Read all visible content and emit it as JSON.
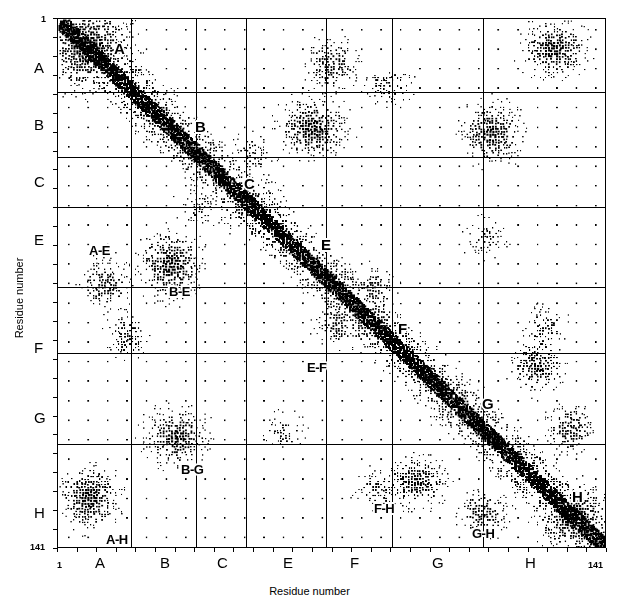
{
  "figure": {
    "type": "contact-map",
    "x_axis": {
      "title": "Residue number",
      "start_label": "1",
      "end_label": "141",
      "ticks": [
        {
          "label": "A",
          "pos_px": 100
        },
        {
          "label": "B",
          "pos_px": 165
        },
        {
          "label": "C",
          "pos_px": 222
        },
        {
          "label": "E",
          "pos_px": 288
        },
        {
          "label": "F",
          "pos_px": 355
        },
        {
          "label": "G",
          "pos_px": 437
        },
        {
          "label": "H",
          "pos_px": 530
        }
      ]
    },
    "y_axis": {
      "title": "Residue number",
      "start_label": "1",
      "end_label": "141",
      "ticks": [
        {
          "label": "A",
          "pos_px": 68
        },
        {
          "label": "B",
          "pos_px": 125
        },
        {
          "label": "C",
          "pos_px": 182
        },
        {
          "label": "E",
          "pos_px": 240
        },
        {
          "label": "F",
          "pos_px": 348
        },
        {
          "label": "G",
          "pos_px": 418
        },
        {
          "label": "H",
          "pos_px": 513
        }
      ]
    },
    "diagonal_labels": [
      {
        "text": "A",
        "x": 113,
        "y": 40
      },
      {
        "text": "B",
        "x": 194,
        "y": 118
      },
      {
        "text": "C",
        "x": 243,
        "y": 175
      },
      {
        "text": "E",
        "x": 320,
        "y": 236
      },
      {
        "text": "F",
        "x": 397,
        "y": 320
      },
      {
        "text": "G",
        "x": 481,
        "y": 395
      },
      {
        "text": "H",
        "x": 571,
        "y": 488
      }
    ],
    "pair_labels": [
      {
        "text": "A-E",
        "x": 88,
        "y": 243
      },
      {
        "text": "B-E",
        "x": 168,
        "y": 284
      },
      {
        "text": "E-F",
        "x": 306,
        "y": 360
      },
      {
        "text": "B-G",
        "x": 180,
        "y": 462
      },
      {
        "text": "A-H",
        "x": 105,
        "y": 532
      },
      {
        "text": "F-H",
        "x": 373,
        "y": 501
      },
      {
        "text": "G-H",
        "x": 471,
        "y": 526
      }
    ]
  },
  "chart_data": {
    "type": "scatter",
    "title": "",
    "xlabel": "Residue number",
    "ylabel": "Residue number",
    "xlim": [
      1,
      141
    ],
    "ylim": [
      1,
      141
    ],
    "y_inverted": true,
    "grid": true,
    "legend": null,
    "segments": [
      {
        "name": "A",
        "start": 3,
        "end": 18
      },
      {
        "name": "B",
        "start": 20,
        "end": 35
      },
      {
        "name": "C",
        "start": 36,
        "end": 49
      },
      {
        "name": "E",
        "start": 58,
        "end": 77
      },
      {
        "name": "F",
        "start": 86,
        "end": 97
      },
      {
        "name": "G",
        "start": 100,
        "end": 118
      },
      {
        "name": "H",
        "start": 124,
        "end": 140
      }
    ],
    "segment_boundaries_px": [
      130,
      195,
      245,
      325,
      391,
      482
    ],
    "contact_clusters": [
      {
        "pair": "A-A",
        "label": "A",
        "intensity": "high",
        "region": "diagonal"
      },
      {
        "pair": "B-B",
        "label": "B",
        "intensity": "high",
        "region": "diagonal"
      },
      {
        "pair": "C-C",
        "label": "C",
        "intensity": "high",
        "region": "diagonal"
      },
      {
        "pair": "E-E",
        "label": "E",
        "intensity": "high",
        "region": "diagonal"
      },
      {
        "pair": "F-F",
        "label": "F",
        "intensity": "high",
        "region": "diagonal"
      },
      {
        "pair": "G-G",
        "label": "G",
        "intensity": "high",
        "region": "diagonal"
      },
      {
        "pair": "H-H",
        "label": "H",
        "intensity": "high",
        "region": "diagonal"
      },
      {
        "pair": "A-E",
        "label": "A-E",
        "intensity": "medium",
        "region": "off-diagonal"
      },
      {
        "pair": "B-E",
        "label": "B-E",
        "intensity": "high",
        "region": "off-diagonal"
      },
      {
        "pair": "E-F",
        "label": "E-F",
        "intensity": "medium",
        "region": "off-diagonal"
      },
      {
        "pair": "B-G",
        "label": "B-G",
        "intensity": "high",
        "region": "off-diagonal"
      },
      {
        "pair": "A-H",
        "label": "A-H",
        "intensity": "high",
        "region": "off-diagonal"
      },
      {
        "pair": "F-H",
        "label": "F-H",
        "intensity": "medium",
        "region": "off-diagonal"
      },
      {
        "pair": "G-H",
        "label": "G-H",
        "intensity": "high",
        "region": "off-diagonal"
      }
    ],
    "cluster_geometry": [
      {
        "cx": 0.055,
        "cy": 0.055,
        "rx": 0.075,
        "ry": 0.075,
        "d": 1.0
      },
      {
        "cx": 0.175,
        "cy": 0.175,
        "rx": 0.045,
        "ry": 0.045,
        "d": 0.85
      },
      {
        "cx": 0.345,
        "cy": 0.345,
        "rx": 0.05,
        "ry": 0.05,
        "d": 0.85
      },
      {
        "cx": 0.57,
        "cy": 0.57,
        "rx": 0.05,
        "ry": 0.05,
        "d": 0.8
      },
      {
        "cx": 0.73,
        "cy": 0.73,
        "rx": 0.045,
        "ry": 0.045,
        "d": 0.8
      },
      {
        "cx": 0.94,
        "cy": 0.94,
        "rx": 0.06,
        "ry": 0.06,
        "d": 1.0
      },
      {
        "cx": 0.085,
        "cy": 0.5,
        "rx": 0.045,
        "ry": 0.045,
        "d": 0.75
      },
      {
        "cx": 0.5,
        "cy": 0.085,
        "rx": 0.045,
        "ry": 0.045,
        "d": 0.75
      },
      {
        "cx": 0.055,
        "cy": 0.905,
        "rx": 0.05,
        "ry": 0.055,
        "d": 0.95
      },
      {
        "cx": 0.905,
        "cy": 0.055,
        "rx": 0.055,
        "ry": 0.05,
        "d": 0.95
      },
      {
        "cx": 0.205,
        "cy": 0.465,
        "rx": 0.055,
        "ry": 0.06,
        "d": 0.95
      },
      {
        "cx": 0.465,
        "cy": 0.205,
        "rx": 0.06,
        "ry": 0.055,
        "d": 0.95
      },
      {
        "cx": 0.215,
        "cy": 0.79,
        "rx": 0.055,
        "ry": 0.05,
        "d": 0.9
      },
      {
        "cx": 0.79,
        "cy": 0.215,
        "rx": 0.05,
        "ry": 0.055,
        "d": 0.9
      },
      {
        "cx": 0.51,
        "cy": 0.575,
        "rx": 0.04,
        "ry": 0.04,
        "d": 0.7
      },
      {
        "cx": 0.575,
        "cy": 0.51,
        "rx": 0.04,
        "ry": 0.04,
        "d": 0.7
      },
      {
        "cx": 0.655,
        "cy": 0.875,
        "rx": 0.05,
        "ry": 0.045,
        "d": 0.85
      },
      {
        "cx": 0.875,
        "cy": 0.655,
        "rx": 0.045,
        "ry": 0.05,
        "d": 0.85
      },
      {
        "cx": 0.775,
        "cy": 0.935,
        "rx": 0.045,
        "ry": 0.04,
        "d": 0.8
      },
      {
        "cx": 0.935,
        "cy": 0.775,
        "rx": 0.04,
        "ry": 0.045,
        "d": 0.8
      },
      {
        "cx": 0.125,
        "cy": 0.6,
        "rx": 0.035,
        "ry": 0.04,
        "d": 0.6
      },
      {
        "cx": 0.6,
        "cy": 0.125,
        "rx": 0.04,
        "ry": 0.035,
        "d": 0.6
      },
      {
        "cx": 0.355,
        "cy": 0.255,
        "rx": 0.035,
        "ry": 0.035,
        "d": 0.55
      },
      {
        "cx": 0.255,
        "cy": 0.355,
        "rx": 0.035,
        "ry": 0.035,
        "d": 0.55
      },
      {
        "cx": 0.415,
        "cy": 0.78,
        "rx": 0.035,
        "ry": 0.035,
        "d": 0.5
      },
      {
        "cx": 0.78,
        "cy": 0.415,
        "rx": 0.035,
        "ry": 0.035,
        "d": 0.5
      },
      {
        "cx": 0.585,
        "cy": 0.89,
        "rx": 0.04,
        "ry": 0.035,
        "d": 0.6
      },
      {
        "cx": 0.89,
        "cy": 0.585,
        "rx": 0.035,
        "ry": 0.04,
        "d": 0.6
      }
    ]
  }
}
